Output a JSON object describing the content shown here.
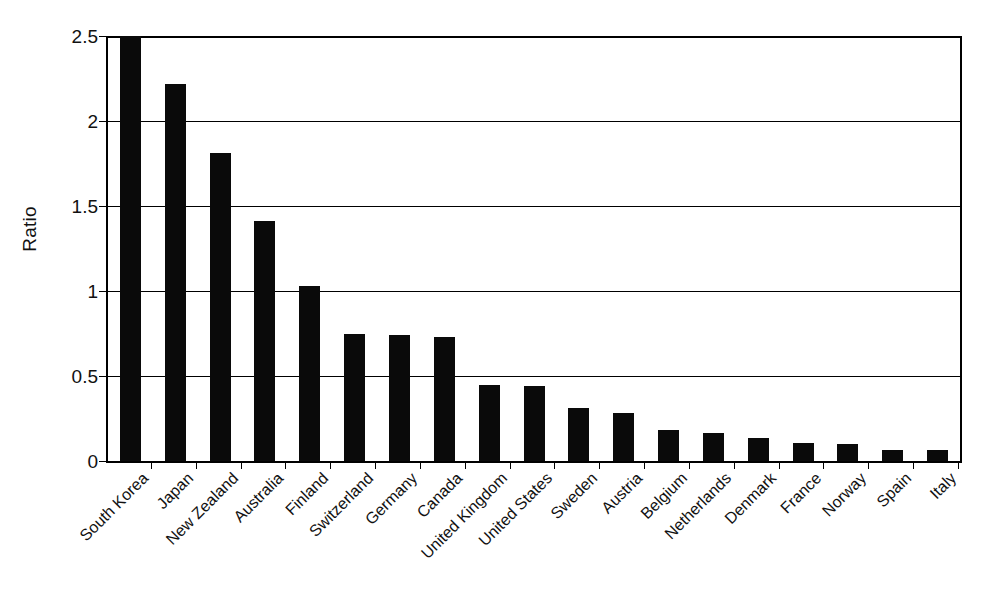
{
  "chart_data": {
    "type": "bar",
    "title": "",
    "subtitle": "",
    "xlabel": "",
    "ylabel": "Ratio",
    "ylim": [
      0,
      2.5
    ],
    "yticks": [
      0,
      0.5,
      1,
      1.5,
      2,
      2.5
    ],
    "ytick_labels": [
      "0",
      "0.5",
      "1",
      "1.5",
      "2",
      "2.5"
    ],
    "grid": true,
    "legend": false,
    "legend_position": "none",
    "bar_color": "#0a0a0a",
    "categories": [
      "South Korea",
      "Japan",
      "New Zealand",
      "Australia",
      "Finland",
      "Switzerland",
      "Germany",
      "Canada",
      "United Kingdom",
      "United States",
      "Sweden",
      "Austria",
      "Belgium",
      "Netherlands",
      "Denmark",
      "France",
      "Norway",
      "Spain",
      "Italy"
    ],
    "values": [
      2.5,
      2.22,
      1.81,
      1.41,
      1.03,
      0.75,
      0.74,
      0.73,
      0.45,
      0.44,
      0.31,
      0.28,
      0.18,
      0.165,
      0.135,
      0.105,
      0.1,
      0.065,
      0.065
    ]
  }
}
